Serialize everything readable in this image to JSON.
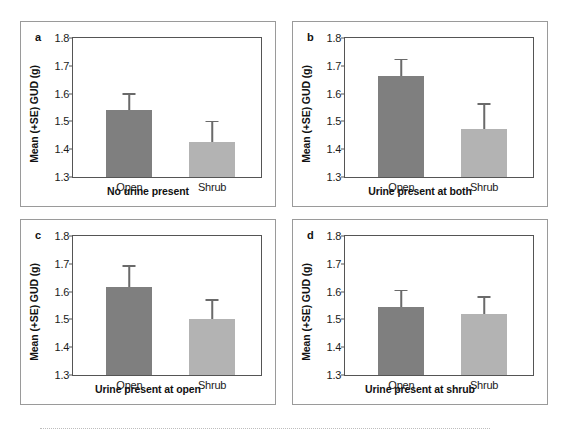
{
  "figure": {
    "background_color": "#ffffff",
    "panel_border_color": "#9a9a9a",
    "axis_color": "#555555",
    "bar_colors": {
      "open": "#7f7f7f",
      "shrub": "#b3b3b3"
    },
    "error_bar_color": "#6a6a6a",
    "bottom_rule": ""
  },
  "chart_data": [
    {
      "type": "bar",
      "panel": "a",
      "title": "",
      "xlabel": "No urine present",
      "ylabel": "Mean (+SE) GUD (g)",
      "categories": [
        "Open",
        "Shrub"
      ],
      "values": [
        1.54,
        1.425
      ],
      "errors": [
        0.062,
        0.077
      ],
      "error_tops": [
        1.602,
        1.502
      ],
      "ylim": [
        1.3,
        1.8
      ],
      "yticks": [
        1.3,
        1.4,
        1.5,
        1.6,
        1.7,
        1.8
      ],
      "ytick_labels": [
        "1.3",
        "1.4",
        "1.5",
        "1.6",
        "1.7",
        "1.8"
      ],
      "grid": false,
      "legend": false,
      "series": [
        {
          "name": "Open",
          "values": [
            1.54
          ],
          "color": "#7f7f7f"
        },
        {
          "name": "Shrub",
          "values": [
            1.425
          ],
          "color": "#b3b3b3"
        }
      ]
    },
    {
      "type": "bar",
      "panel": "b",
      "title": "",
      "xlabel": "Urine present at both",
      "ylabel": "Mean (+SE) GUD (g)",
      "categories": [
        "Open",
        "Shrub"
      ],
      "values": [
        1.663,
        1.473
      ],
      "errors": [
        0.062,
        0.092
      ],
      "error_tops": [
        1.725,
        1.565
      ],
      "ylim": [
        1.3,
        1.8
      ],
      "yticks": [
        1.3,
        1.4,
        1.5,
        1.6,
        1.7,
        1.8
      ],
      "ytick_labels": [
        "1.3",
        "1.4",
        "1.5",
        "1.6",
        "1.7",
        "1.8"
      ],
      "grid": false,
      "legend": false,
      "series": [
        {
          "name": "Open",
          "values": [
            1.663
          ],
          "color": "#7f7f7f"
        },
        {
          "name": "Shrub",
          "values": [
            1.473
          ],
          "color": "#b3b3b3"
        }
      ]
    },
    {
      "type": "bar",
      "panel": "c",
      "title": "",
      "xlabel": "Urine present at open",
      "ylabel": "Mean (+SE) GUD (g)",
      "categories": [
        "Open",
        "Shrub"
      ],
      "values": [
        1.615,
        1.503
      ],
      "errors": [
        0.08,
        0.069
      ],
      "error_tops": [
        1.695,
        1.572
      ],
      "ylim": [
        1.3,
        1.8
      ],
      "yticks": [
        1.3,
        1.4,
        1.5,
        1.6,
        1.7,
        1.8
      ],
      "ytick_labels": [
        "1.3",
        "1.4",
        "1.5",
        "1.6",
        "1.7",
        "1.8"
      ],
      "grid": false,
      "legend": false,
      "series": [
        {
          "name": "Open",
          "values": [
            1.615
          ],
          "color": "#7f7f7f"
        },
        {
          "name": "Shrub",
          "values": [
            1.503
          ],
          "color": "#b3b3b3"
        }
      ]
    },
    {
      "type": "bar",
      "panel": "d",
      "title": "",
      "xlabel": "Urine present at shrub",
      "ylabel": "Mean (+SE) GUD (g)",
      "categories": [
        "Open",
        "Shrub"
      ],
      "values": [
        1.545,
        1.518
      ],
      "errors": [
        0.062,
        0.065
      ],
      "error_tops": [
        1.607,
        1.583
      ],
      "ylim": [
        1.3,
        1.8
      ],
      "yticks": [
        1.3,
        1.4,
        1.5,
        1.6,
        1.7,
        1.8
      ],
      "ytick_labels": [
        "1.3",
        "1.4",
        "1.5",
        "1.6",
        "1.7",
        "1.8"
      ],
      "grid": false,
      "legend": false,
      "series": [
        {
          "name": "Open",
          "values": [
            1.545
          ],
          "color": "#7f7f7f"
        },
        {
          "name": "Shrub",
          "values": [
            1.518
          ],
          "color": "#b3b3b3"
        }
      ]
    }
  ],
  "panels": [
    {
      "letter": "a",
      "xlabel": "No urine present",
      "ylabel": "Mean (+SE) GUD (g)",
      "ytick_labels": [
        "1.8",
        "1.7",
        "1.6",
        "1.5",
        "1.4",
        "1.3"
      ],
      "xtick_labels": [
        "Open",
        "Shrub"
      ]
    },
    {
      "letter": "b",
      "xlabel": "Urine present at both",
      "ylabel": "Mean (+SE) GUD (g)",
      "ytick_labels": [
        "1.8",
        "1.7",
        "1.6",
        "1.5",
        "1.4",
        "1.3"
      ],
      "xtick_labels": [
        "Open",
        "Shrub"
      ]
    },
    {
      "letter": "c",
      "xlabel": "Urine present at open",
      "ylabel": "Mean (+SE) GUD (g)",
      "ytick_labels": [
        "1.8",
        "1.7",
        "1.6",
        "1.5",
        "1.4",
        "1.3"
      ],
      "xtick_labels": [
        "Open",
        "Shrub"
      ]
    },
    {
      "letter": "d",
      "xlabel": "Urine present at shrub",
      "ylabel": "Mean (+SE) GUD (g)",
      "ytick_labels": [
        "1.8",
        "1.7",
        "1.6",
        "1.5",
        "1.4",
        "1.3"
      ],
      "xtick_labels": [
        "Open",
        "Shrub"
      ]
    }
  ]
}
